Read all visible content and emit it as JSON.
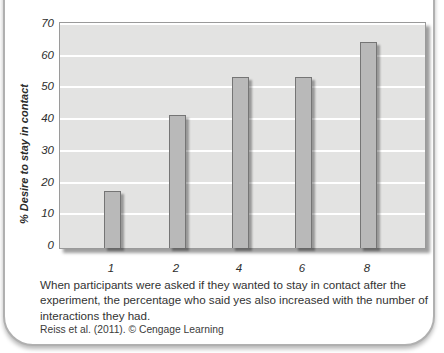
{
  "figure": {
    "caption": "When participants were asked if they wanted to stay in contact after the experiment, the percentage who said yes also increased with the number of interactions they had.",
    "source": "Reiss et al. (2011). © Cengage Learning"
  },
  "chart_data": {
    "type": "bar",
    "categories": [
      "1",
      "2",
      "4",
      "6",
      "8"
    ],
    "values": [
      17,
      41,
      53,
      53,
      64
    ],
    "title": "",
    "xlabel": "",
    "ylabel": "% Desire to stay in contact",
    "yticks": [
      0,
      10,
      20,
      30,
      40,
      50,
      60,
      70
    ],
    "ylim": [
      0,
      70
    ],
    "grid": true,
    "legend": "none",
    "colors": {
      "bar_fill": "#b9b9b9",
      "bar_border": "#757575",
      "plot_background": "#e3e3e2",
      "gridline": "#ffffff",
      "card_border": "#b0b0b0",
      "text": "#2e2e2e"
    }
  }
}
